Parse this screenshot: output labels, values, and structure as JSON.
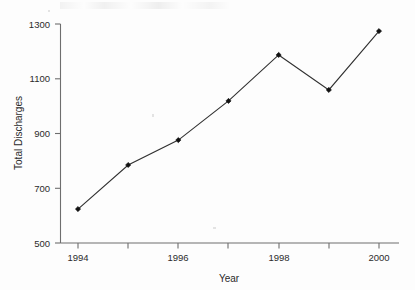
{
  "chart_data": {
    "type": "line",
    "title": "",
    "xlabel": "Year",
    "ylabel": "Total Discharges",
    "x": [
      1994,
      1995,
      1996,
      1997,
      1998,
      1999,
      2000
    ],
    "values": [
      624,
      785,
      876,
      1019,
      1187,
      1059,
      1274
    ],
    "series": [
      {
        "name": "Total Discharges",
        "values": [
          624,
          785,
          876,
          1019,
          1187,
          1059,
          1274
        ]
      }
    ],
    "xlim": [
      1993.6,
      2000.4
    ],
    "ylim": [
      500,
      1300
    ],
    "xticks": [
      1994,
      1995,
      1996,
      1997,
      1998,
      1999,
      2000
    ],
    "xtick_labels": [
      "1994",
      "",
      "1996",
      "",
      "1998",
      "",
      "2000"
    ],
    "yticks": [
      500,
      700,
      900,
      1100,
      1300
    ],
    "ytick_labels": [
      "500",
      "700",
      "900",
      "1100",
      "1300"
    ],
    "grid": false,
    "legend": "none",
    "marker": "filled-diamond",
    "line_color": "#303030",
    "marker_color": "#111111",
    "axis_color": "#6e6e6e"
  },
  "axes": {
    "y_title": "Total Discharges",
    "x_title": "Year",
    "y_tick_0": "500",
    "y_tick_1": "700",
    "y_tick_2": "900",
    "y_tick_3": "1100",
    "y_tick_4": "1300",
    "x_tick_1994": "1994",
    "x_tick_1996": "1996",
    "x_tick_1998": "1998",
    "x_tick_2000": "2000"
  }
}
